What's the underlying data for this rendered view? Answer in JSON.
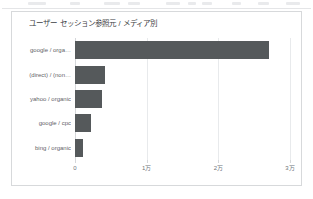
{
  "card": {
    "title": "ユーザー セッション参照元 / メディア別"
  },
  "chart_data": {
    "type": "bar",
    "orientation": "horizontal",
    "title": "ユーザー セッション参照元 / メディア別",
    "xlabel": "",
    "ylabel": "",
    "categories": [
      "google / orga…",
      "(direct) / (non…",
      "yahoo / organic",
      "google / cpc",
      "bing / organic"
    ],
    "values": [
      27000,
      4200,
      3800,
      2200,
      1100
    ],
    "xlim": [
      0,
      30000
    ],
    "xticks": [
      0,
      10000,
      20000,
      30000
    ],
    "xticklabels": [
      "0",
      "1万",
      "2万",
      "3万"
    ],
    "grid": true,
    "legend": false,
    "bar_color": "#55595b",
    "grid_color": "#e8eaec"
  }
}
